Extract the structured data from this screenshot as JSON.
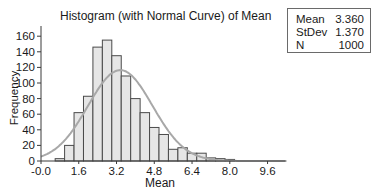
{
  "chart_data": {
    "type": "bar",
    "title": "Histogram (with Normal Curve) of Mean",
    "xlabel": "Mean",
    "ylabel": "Frequency",
    "xlim": [
      -0.0,
      10.4
    ],
    "ylim": [
      0,
      170
    ],
    "x_ticks": [
      "-0.0",
      "1.6",
      "3.2",
      "4.8",
      "6.4",
      "8.0",
      "9.6"
    ],
    "x_tick_values": [
      0,
      1.6,
      3.2,
      4.8,
      6.4,
      8.0,
      9.6
    ],
    "y_ticks": [
      "0",
      "20",
      "40",
      "60",
      "80",
      "100",
      "120",
      "140",
      "160"
    ],
    "y_tick_values": [
      0,
      20,
      40,
      60,
      80,
      100,
      120,
      140,
      160
    ],
    "bin_width": 0.4,
    "bin_centers": [
      0.8,
      1.2,
      1.6,
      2.0,
      2.4,
      2.8,
      3.2,
      3.6,
      4.0,
      4.4,
      4.8,
      5.2,
      5.6,
      6.0,
      6.4,
      6.8,
      7.2,
      7.6,
      8.0
    ],
    "values": [
      3,
      20,
      62,
      83,
      146,
      155,
      135,
      109,
      80,
      62,
      43,
      34,
      15,
      17,
      10,
      10,
      4,
      3,
      2
    ],
    "normal_curve": {
      "mean": 3.36,
      "stdev": 1.37,
      "n": 1000
    },
    "grid": false,
    "legend_position": "top-right stats box"
  },
  "stats_box": {
    "rows": [
      {
        "label": "Mean",
        "value": "3.360"
      },
      {
        "label": "StDev",
        "value": "1.370"
      },
      {
        "label": "N",
        "value": "1000"
      }
    ]
  },
  "colors": {
    "bar_fill": "#e6e6e6",
    "bar_stroke": "#4a4a4a",
    "curve": "#a8a8a8",
    "axis": "#3a3a3a",
    "text": "#1a1a1a"
  }
}
